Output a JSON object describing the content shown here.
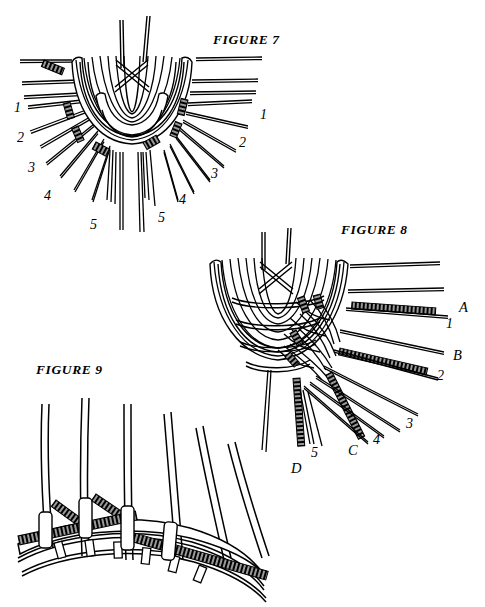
{
  "page": {
    "kind": "line-art instructional plate",
    "background_color": "#ffffff",
    "ink_color": "#000000",
    "width": 485,
    "height": 607
  },
  "figures": [
    {
      "id": "figure-7",
      "title": "FIGURE 7",
      "title_pos": {
        "x": 213,
        "y": 32
      },
      "labels": [
        {
          "text": "1",
          "x": 14,
          "y": 101,
          "side": "left"
        },
        {
          "text": "2",
          "x": 17,
          "y": 131,
          "side": "left"
        },
        {
          "text": "3",
          "x": 28,
          "y": 161,
          "side": "left"
        },
        {
          "text": "4",
          "x": 44,
          "y": 189,
          "side": "left"
        },
        {
          "text": "5",
          "x": 90,
          "y": 218,
          "side": "left"
        },
        {
          "text": "1",
          "x": 260,
          "y": 108,
          "side": "right"
        },
        {
          "text": "2",
          "x": 239,
          "y": 136,
          "side": "right"
        },
        {
          "text": "3",
          "x": 211,
          "y": 167,
          "side": "right"
        },
        {
          "text": "4",
          "x": 179,
          "y": 193,
          "side": "right"
        },
        {
          "text": "5",
          "x": 158,
          "y": 211,
          "side": "right"
        }
      ]
    },
    {
      "id": "figure-8",
      "title": "FIGURE 8",
      "title_pos": {
        "x": 341,
        "y": 222
      },
      "labels": [
        {
          "text": "A",
          "x": 459,
          "y": 300,
          "side": "right"
        },
        {
          "text": "1",
          "x": 446,
          "y": 317,
          "side": "right"
        },
        {
          "text": "B",
          "x": 453,
          "y": 348,
          "side": "right"
        },
        {
          "text": "2",
          "x": 437,
          "y": 369,
          "side": "right"
        },
        {
          "text": "3",
          "x": 406,
          "y": 417,
          "side": "right"
        },
        {
          "text": "4",
          "x": 373,
          "y": 433,
          "side": "right"
        },
        {
          "text": "C",
          "x": 348,
          "y": 443,
          "side": "right"
        },
        {
          "text": "5",
          "x": 311,
          "y": 446,
          "side": "right"
        },
        {
          "text": "D",
          "x": 291,
          "y": 461,
          "side": "right"
        }
      ]
    },
    {
      "id": "figure-9",
      "title": "FIGURE 9",
      "title_pos": {
        "x": 36,
        "y": 362
      },
      "labels": []
    }
  ]
}
